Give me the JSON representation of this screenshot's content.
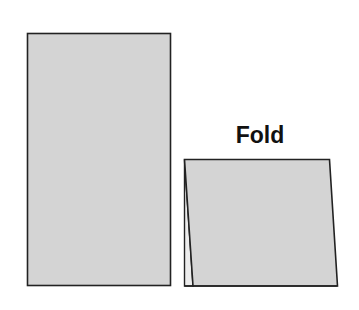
{
  "diagram": {
    "label": "Fold",
    "colors": {
      "fill": "#d4d4d4",
      "stroke": "#222222",
      "background": "#ffffff",
      "text": "#111111"
    },
    "shapes": [
      {
        "name": "unfolded-sheet",
        "description": "Flat vertical rectangle of paper"
      },
      {
        "name": "folded-tent-card",
        "description": "Sheet folded into a tent card, seen from the front"
      }
    ]
  }
}
